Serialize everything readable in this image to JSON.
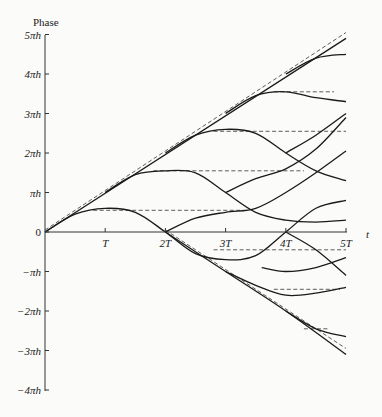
{
  "chart_data": {
    "type": "line",
    "title": "",
    "ylabel": "Phase",
    "xlabel": "t",
    "x_ticks": [
      "T",
      "2T",
      "3T",
      "4T",
      "5T"
    ],
    "x_tick_values": [
      1,
      2,
      3,
      4,
      5
    ],
    "y_ticks": [
      "5πh",
      "4πh",
      "3πh",
      "2πh",
      "πh",
      "0",
      "−πh",
      "−2πh",
      "−3πh",
      "−4πh"
    ],
    "y_tick_values": [
      5,
      4,
      3,
      2,
      1,
      0,
      -1,
      -2,
      -3,
      -4
    ],
    "xlim": [
      0,
      5
    ],
    "ylim": [
      -4,
      5
    ],
    "units": {
      "x": "T",
      "y": "πh"
    },
    "grid": false,
    "legend": null,
    "dashed_series": [
      {
        "name": "upper-diagonal",
        "points": [
          [
            0,
            0
          ],
          [
            5,
            5
          ]
        ]
      },
      {
        "name": "lower-diagonal",
        "points": [
          [
            2,
            0
          ],
          [
            5,
            -3
          ]
        ]
      },
      {
        "name": "plateau-0.5",
        "points": [
          [
            0.8,
            0.5
          ],
          [
            3.3,
            0.5
          ]
        ]
      },
      {
        "name": "plateau-1.5",
        "points": [
          [
            1.8,
            1.5
          ],
          [
            4.3,
            1.5
          ]
        ]
      },
      {
        "name": "plateau-2.5",
        "points": [
          [
            2.8,
            2.5
          ],
          [
            5,
            2.5
          ]
        ]
      },
      {
        "name": "plateau-3.5",
        "points": [
          [
            3.8,
            3.5
          ],
          [
            4.8,
            3.5
          ]
        ]
      },
      {
        "name": "plateau-neg0.5",
        "points": [
          [
            2.8,
            -0.5
          ],
          [
            5,
            -0.5
          ]
        ]
      },
      {
        "name": "plateau-neg1.5",
        "points": [
          [
            3.8,
            -1.5
          ],
          [
            4.9,
            -1.5
          ]
        ]
      },
      {
        "name": "plateau-neg2.5",
        "points": [
          [
            4.3,
            -2.5
          ],
          [
            4.7,
            -2.5
          ]
        ]
      }
    ],
    "solid_series": [
      {
        "name": "upper-line",
        "points": [
          [
            0,
            0
          ],
          [
            5,
            4.9
          ]
        ]
      },
      {
        "name": "arc-a",
        "points": [
          [
            0,
            0
          ],
          [
            0.5,
            0.45
          ],
          [
            1,
            0.6
          ],
          [
            1.5,
            0.5
          ],
          [
            2,
            0
          ],
          [
            2.5,
            -0.55
          ],
          [
            3,
            -0.7
          ],
          [
            3.5,
            -0.6
          ],
          [
            4,
            0
          ],
          [
            4.5,
            0.6
          ],
          [
            5,
            0.8
          ]
        ]
      },
      {
        "name": "arc-b",
        "points": [
          [
            1,
            1
          ],
          [
            1.5,
            1.45
          ],
          [
            2,
            1.55
          ],
          [
            2.5,
            1.5
          ],
          [
            3,
            1.0
          ],
          [
            3.5,
            0.5
          ],
          [
            4,
            0.3
          ],
          [
            4.5,
            0.25
          ],
          [
            5,
            0.3
          ]
        ]
      },
      {
        "name": "arc-c",
        "points": [
          [
            2,
            2
          ],
          [
            2.5,
            2.45
          ],
          [
            3,
            2.6
          ],
          [
            3.5,
            2.5
          ],
          [
            4,
            2.0
          ],
          [
            4.5,
            1.55
          ],
          [
            5,
            1.3
          ]
        ]
      },
      {
        "name": "arc-d",
        "points": [
          [
            3,
            3
          ],
          [
            3.5,
            3.45
          ],
          [
            4,
            3.55
          ],
          [
            4.5,
            3.4
          ],
          [
            5,
            3.3
          ]
        ]
      },
      {
        "name": "arc-e",
        "points": [
          [
            4,
            4
          ],
          [
            4.5,
            4.4
          ],
          [
            5,
            4.5
          ]
        ]
      },
      {
        "name": "arc-f",
        "points": [
          [
            2,
            0
          ],
          [
            2.5,
            0.35
          ],
          [
            3,
            0.5
          ],
          [
            3.5,
            0.6
          ],
          [
            4,
            1.0
          ],
          [
            4.5,
            1.5
          ],
          [
            5,
            2.05
          ]
        ]
      },
      {
        "name": "arc-g",
        "points": [
          [
            3,
            1.0
          ],
          [
            3.5,
            1.35
          ],
          [
            4,
            1.6
          ],
          [
            4.5,
            2.1
          ],
          [
            5,
            2.9
          ]
        ]
      },
      {
        "name": "arc-h",
        "points": [
          [
            4,
            2.0
          ],
          [
            4.5,
            2.45
          ],
          [
            5,
            3.0
          ]
        ]
      },
      {
        "name": "lower-line",
        "points": [
          [
            2,
            0
          ],
          [
            3,
            -1
          ],
          [
            4,
            -2
          ],
          [
            5,
            -3.1
          ]
        ]
      },
      {
        "name": "arc-i",
        "points": [
          [
            3,
            -1
          ],
          [
            3.5,
            -1.35
          ],
          [
            4,
            -1.6
          ],
          [
            4.5,
            -1.55
          ],
          [
            5,
            -1.4
          ]
        ]
      },
      {
        "name": "arc-j",
        "points": [
          [
            4,
            0
          ],
          [
            4.5,
            -0.45
          ],
          [
            5,
            -1.1
          ]
        ]
      },
      {
        "name": "arc-k",
        "points": [
          [
            3.6,
            -0.9
          ],
          [
            4,
            -1.0
          ],
          [
            4.5,
            -0.9
          ],
          [
            5,
            -0.65
          ]
        ]
      },
      {
        "name": "arc-l",
        "points": [
          [
            4,
            -2
          ],
          [
            4.5,
            -2.45
          ],
          [
            5,
            -2.65
          ]
        ]
      }
    ]
  },
  "axes": {
    "y_title": "Phase",
    "x_title": "t",
    "y_tick_labels": [
      "5πh",
      "4πh",
      "3πh",
      "2πh",
      "πh",
      "0",
      "−πh",
      "−2πh",
      "−3πh",
      "−4πh"
    ],
    "x_tick_labels": [
      "T",
      "2T",
      "3T",
      "4T",
      "5T"
    ]
  }
}
